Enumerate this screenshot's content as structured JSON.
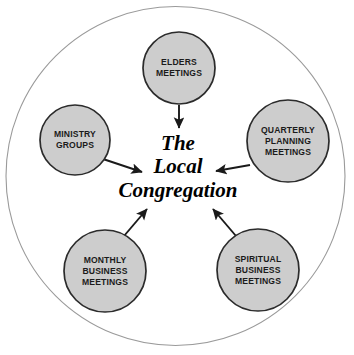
{
  "diagram": {
    "title_center": {
      "line1": "The",
      "line2": "Local",
      "line3": "Congregation"
    },
    "outer_boundary": {
      "name": "outer-circle",
      "stroke": "#9a9a9a",
      "fill": "#ffffff"
    },
    "style": {
      "node_fill": "#cdcdcd",
      "node_stroke": "#2b2b2b",
      "arrow_color": "#1a1a1a",
      "label_color": "#1b1b1b",
      "center_text_color": "#000000",
      "background": "#ffffff"
    },
    "nodes": [
      {
        "id": "elders-meetings",
        "lines": [
          "ELDERS",
          "MEETINGS"
        ],
        "cx": 179,
        "cy": 68,
        "r": 36
      },
      {
        "id": "ministry-groups",
        "lines": [
          "MINISTRY",
          "GROUPS"
        ],
        "cx": 75,
        "cy": 140,
        "r": 35
      },
      {
        "id": "quarterly-planning-meetings",
        "lines": [
          "QUARTERLY",
          "PLANNING",
          "MEETINGS"
        ],
        "cx": 288,
        "cy": 141,
        "r": 41
      },
      {
        "id": "monthly-business-meetings",
        "lines": [
          "MONTHLY",
          "BUSINESS",
          "MEETINGS"
        ],
        "cx": 105,
        "cy": 271,
        "r": 41
      },
      {
        "id": "spiritual-business-meetings",
        "lines": [
          "SPIRITUAL",
          "BUSINESS",
          "MEETINGS"
        ],
        "cx": 258,
        "cy": 270,
        "r": 41
      }
    ],
    "arrows": [
      {
        "id": "arrow-elders-to-center",
        "from": "elders-meetings",
        "to": "center",
        "x1": 179,
        "y1": 105,
        "x2": 179,
        "y2": 129
      },
      {
        "id": "arrow-ministry-to-center",
        "from": "ministry-groups",
        "to": "center",
        "x1": 103,
        "y1": 159,
        "x2": 144,
        "y2": 173
      },
      {
        "id": "arrow-quarterly-to-center",
        "from": "quarterly-planning-meetings",
        "to": "center",
        "x1": 249,
        "y1": 165,
        "x2": 214,
        "y2": 171
      },
      {
        "id": "arrow-monthly-to-center",
        "from": "monthly-business-meetings",
        "to": "center",
        "x1": 124,
        "y1": 236,
        "x2": 148,
        "y2": 207
      },
      {
        "id": "arrow-spiritual-to-center",
        "from": "spiritual-business-meetings",
        "to": "center",
        "x1": 236,
        "y1": 236,
        "x2": 212,
        "y2": 207
      }
    ]
  }
}
